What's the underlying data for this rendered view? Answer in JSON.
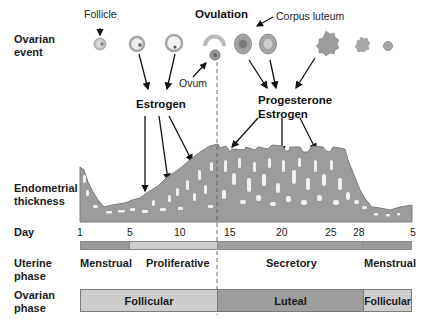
{
  "diagram": {
    "row_labels": {
      "ovarian_event": [
        "Ovarian",
        "event"
      ],
      "endometrial_thickness": [
        "Endometrial",
        "thickness"
      ],
      "day": "Day",
      "uterine_phase": [
        "Uterine",
        "phase"
      ],
      "ovarian_phase": [
        "Ovarian",
        "phase"
      ]
    },
    "ovarian_event": {
      "follicle_label": "Follicle",
      "ovulation_label": "Ovulation",
      "ovum_label": "Ovum",
      "corpus_luteum_label": "Corpus luteum"
    },
    "hormones": {
      "estrogen_label": "Estrogen",
      "progesterone_label": "Progesterone",
      "estrogen2_label": "Estrogen"
    },
    "day_ticks": [
      {
        "label": "1",
        "x": 79
      },
      {
        "label": "5",
        "x": 129
      },
      {
        "label": "10",
        "x": 175
      },
      {
        "label": "15",
        "x": 230
      },
      {
        "label": "20",
        "x": 281
      },
      {
        "label": "25",
        "x": 330
      },
      {
        "label": "28",
        "x": 359
      },
      {
        "label": "5",
        "x": 410
      }
    ],
    "uterine_phases": [
      {
        "label": "Menstrual",
        "start_day": 1,
        "end_day": 5,
        "color": "#9a9a9a"
      },
      {
        "label": "Proliferative",
        "start_day": 5,
        "end_day": 14,
        "color": "#cfcfcf"
      },
      {
        "label": "Secretory",
        "start_day": 14,
        "end_day": 28,
        "color": "#a0a0a0"
      },
      {
        "label": "Menstrual",
        "start_day": 28,
        "end_day": 5,
        "color": "#9a9a9a"
      }
    ],
    "ovarian_phases": [
      {
        "label": "Follicular",
        "color": "#cdcdcd"
      },
      {
        "label": "Luteal",
        "color": "#9e9e9e"
      },
      {
        "label": "Follicular",
        "color": "#cdcdcd"
      }
    ],
    "colors": {
      "endometrium": "#9c9c9c",
      "endometrium_edge": "#7c7c7c",
      "arrow": "#111111",
      "dashed_line": "#666666"
    }
  }
}
